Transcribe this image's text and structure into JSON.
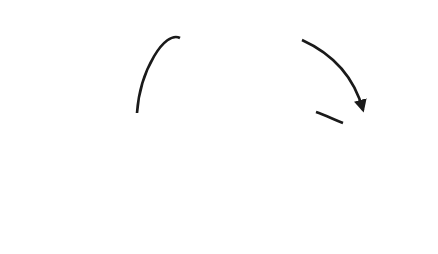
{
  "diagram": {
    "type": "flow",
    "nodes": {
      "company": {
        "label": "Company"
      },
      "supplier": {
        "label": "Supplier"
      },
      "receiving_report": {
        "label_line1": "Receiving",
        "label_line2": "Report",
        "step": "3"
      },
      "purchase_order": {
        "label_line1": "Purchase",
        "label_line2": "Order",
        "step": "1"
      },
      "merchandise_inventory": {
        "label_line1": "Merchandise",
        "label_line2": "Inventory",
        "step": "2"
      },
      "invoice": {
        "label": "Invoice",
        "step": "2"
      },
      "cheque": {
        "label": "Cheque",
        "step": "4"
      }
    },
    "edges": [
      {
        "from": "Company",
        "via": "Purchase Order",
        "to": "Supplier"
      },
      {
        "from": "Supplier",
        "via": "Merchandise Inventory",
        "to": "Company"
      },
      {
        "from": "Supplier",
        "via": "Invoice",
        "to": "Company"
      },
      {
        "from": "Company",
        "via": "Cheque",
        "to": "Supplier"
      }
    ],
    "colors": {
      "ellipse_fill": "#e6e6e6",
      "box_fill": "#e4e4e4",
      "stroke": "#1a1a1a",
      "badge": "#1a1a1a",
      "faded_fill": "#f4f4f4",
      "faded_stroke": "#d8d8d8"
    }
  }
}
